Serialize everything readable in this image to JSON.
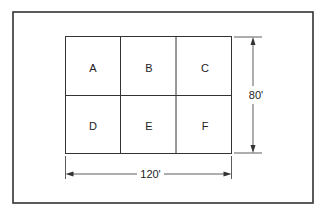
{
  "diagram": {
    "type": "floor-plan-grid",
    "rows": 2,
    "columns": 3,
    "cells": [
      "A",
      "B",
      "C",
      "D",
      "E",
      "F"
    ],
    "dimensions": {
      "width_label": "120'",
      "height_label": "80'"
    },
    "colors": {
      "line": "#333333",
      "background": "#ffffff"
    }
  }
}
